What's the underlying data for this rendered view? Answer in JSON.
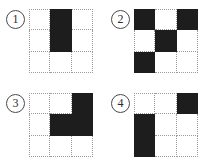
{
  "page": {
    "grid_rows": 3,
    "grid_cols": 3,
    "fill_color": "#1d1d1d",
    "empty_color": "#ffffff",
    "gridline_color": "#9b9b9b",
    "background_color": "#ffffff"
  },
  "panels": [
    {
      "label": "1",
      "badge_name": "option-number-1",
      "grid_name": "pattern-grid-1",
      "cells": [
        "empty",
        "filled",
        "empty",
        "empty",
        "filled",
        "empty",
        "empty",
        "empty",
        "empty"
      ],
      "filled_count": 2
    },
    {
      "label": "2",
      "badge_name": "option-number-2",
      "grid_name": "pattern-grid-2",
      "cells": [
        "filled",
        "empty",
        "filled",
        "empty",
        "filled",
        "empty",
        "filled",
        "empty",
        "empty"
      ],
      "filled_count": 4
    },
    {
      "label": "3",
      "badge_name": "option-number-3",
      "grid_name": "pattern-grid-3",
      "cells": [
        "empty",
        "empty",
        "filled",
        "empty",
        "filled",
        "filled",
        "empty",
        "empty",
        "empty"
      ],
      "filled_count": 3
    },
    {
      "label": "4",
      "badge_name": "option-number-4",
      "grid_name": "pattern-grid-4",
      "cells": [
        "empty",
        "empty",
        "filled",
        "filled",
        "empty",
        "empty",
        "filled",
        "empty",
        "empty"
      ],
      "filled_count": 3
    }
  ]
}
